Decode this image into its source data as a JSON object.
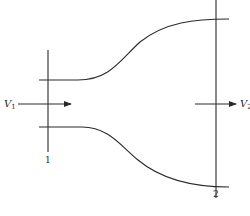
{
  "figure": {
    "type": "converging-diverging duct (expanding pipe section)",
    "inlet_velocity": {
      "symbol": "V",
      "subscript": "1"
    },
    "outlet_velocity": {
      "symbol": "V",
      "subscript": "2"
    },
    "section_labels": [
      "1",
      "2"
    ],
    "caption": "",
    "colors": {
      "line": "#2a2a2a",
      "background": "#ffffff"
    }
  }
}
